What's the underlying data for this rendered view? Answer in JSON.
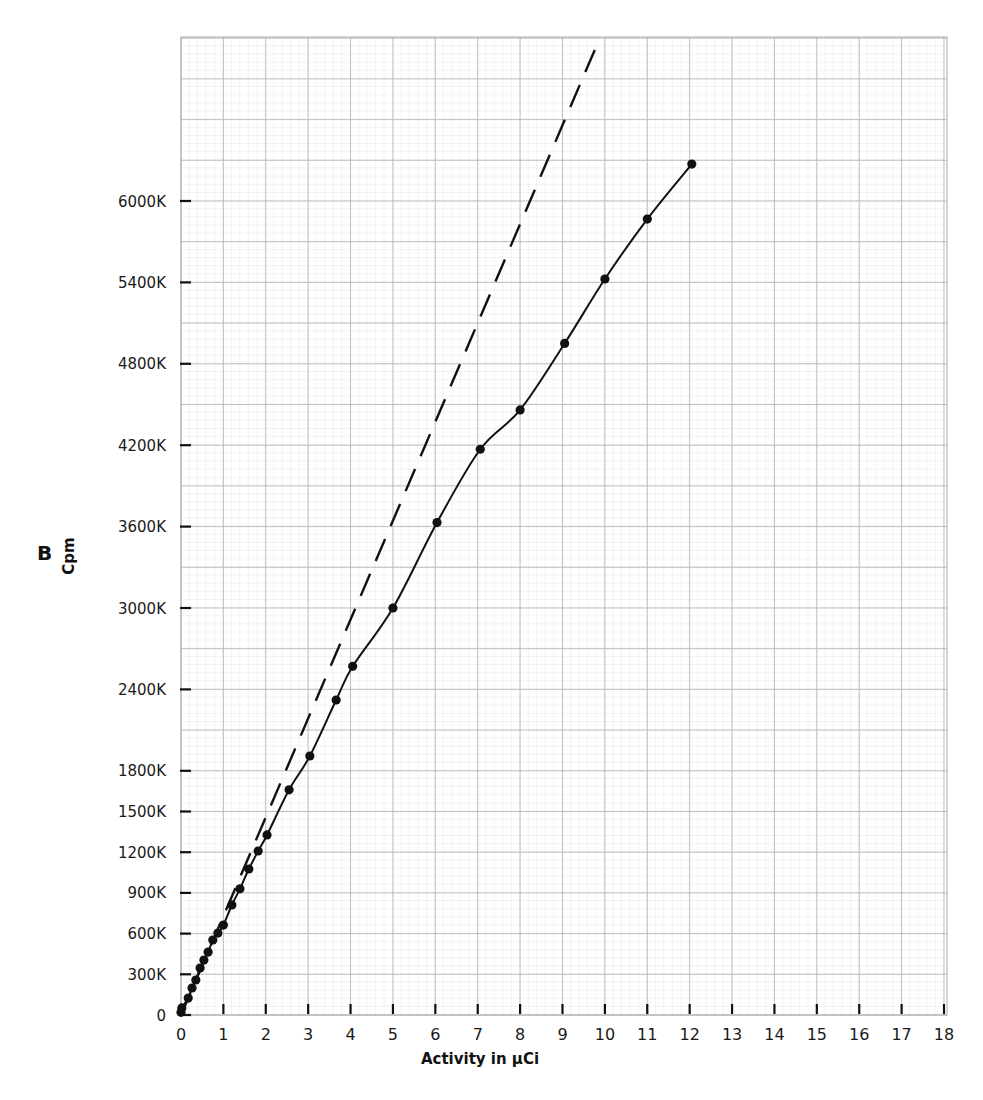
{
  "chart_data": {
    "type": "line",
    "title": "",
    "panel_label": "B",
    "xlabel": "Activity in µCi",
    "ylabel": "Cpm",
    "xlim": [
      0,
      18
    ],
    "ylim": [
      0,
      7200000
    ],
    "grid": true,
    "legend": null,
    "x_ticks": [
      0,
      1,
      2,
      3,
      4,
      5,
      6,
      7,
      8,
      9,
      10,
      11,
      12,
      13,
      14,
      15,
      16,
      17,
      18
    ],
    "x_tick_labels": [
      "0",
      "1",
      "2",
      "3",
      "4",
      "5",
      "6",
      "7",
      "8",
      "9",
      "10",
      "11",
      "12",
      "13",
      "14",
      "15",
      "16",
      "17",
      "18"
    ],
    "y_ticks": [
      0,
      300000,
      600000,
      900000,
      1200000,
      1500000,
      1800000,
      2400000,
      3000000,
      3600000,
      4200000,
      4800000,
      5400000,
      6000000
    ],
    "y_tick_labels": [
      "0",
      "300K",
      "600K",
      "900K",
      "1200K",
      "1500K",
      "1800K",
      "2400K",
      "3000K",
      "3600K",
      "4200K",
      "4800K",
      "5400K",
      "6000K"
    ],
    "series": [
      {
        "name": "measured",
        "style": "solid-with-markers",
        "x": [
          0,
          0.02,
          0.17,
          0.26,
          0.35,
          0.45,
          0.54,
          0.64,
          0.75,
          0.87,
          1.0,
          1.2,
          1.39,
          1.6,
          1.82,
          2.03,
          2.55,
          3.04,
          3.66,
          4.05,
          5.0,
          6.04,
          7.06,
          8.0,
          9.05,
          10.0,
          11.0,
          12.05
        ],
        "y": [
          20000,
          52000,
          125000,
          199000,
          258000,
          346000,
          405000,
          464000,
          553000,
          604000,
          663000,
          811000,
          930000,
          1076000,
          1209000,
          1327000,
          1660000,
          1909000,
          2322000,
          2570000,
          3000000,
          3630000,
          4170000,
          4460000,
          4950000,
          5425000,
          5867000,
          6272000
        ]
      },
      {
        "name": "ideal-linear",
        "style": "dashed",
        "x": [
          0,
          9.88
        ],
        "y": [
          0,
          7200000
        ]
      }
    ],
    "annotations": []
  }
}
